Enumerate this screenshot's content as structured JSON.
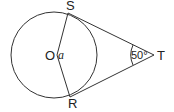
{
  "diagram": {
    "type": "geometry",
    "labels": {
      "center": "O",
      "angle_at_center": "a",
      "point_top": "S",
      "point_bottom": "R",
      "external_point": "T",
      "angle_at_T": "50°"
    },
    "colors": {
      "stroke": "#333333",
      "text": "#222222",
      "background": "#ffffff"
    }
  }
}
